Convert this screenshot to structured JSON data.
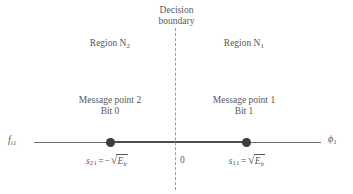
{
  "figure": {
    "type": "signal-space-constellation",
    "background_color": "#ffffff",
    "text_color": "#58585a",
    "line_color": "#4d4d4f",
    "dashed_color": "#9c9c9e",
    "point_color": "#3c3c3e"
  },
  "boundary_caption": {
    "line1": "Decision",
    "line2": "boundary"
  },
  "regions": {
    "left": {
      "prefix": "Region N",
      "subscript": "2"
    },
    "right": {
      "prefix": "Region N",
      "subscript": "1"
    }
  },
  "messages": {
    "left": {
      "line1": "Message point 2",
      "line2": "Bit 0"
    },
    "right": {
      "line1": "Message point 1",
      "line2": "Bit 1"
    }
  },
  "axis": {
    "left_label": {
      "symbol": "f",
      "subscript": "i1"
    },
    "right_label": {
      "symbol": "ϕ",
      "subscript": "1"
    },
    "origin_label": "0"
  },
  "values": {
    "left": {
      "symbol": "s",
      "subscript": "21",
      "equals": "=",
      "sign": "−",
      "radical": "√",
      "radicand": "E",
      "radicand_subscript": "b"
    },
    "right": {
      "symbol": "s",
      "subscript": "11",
      "equals": "=",
      "sign": "",
      "radical": "√",
      "radicand": "E",
      "radicand_subscript": "b"
    }
  },
  "chart_data": {
    "type": "scatter",
    "title": "Decision boundary",
    "xlabel": "ϕ1",
    "ylabel": "",
    "xlim": [
      -1.55,
      1.45
    ],
    "ylim": [
      0,
      0
    ],
    "grid": false,
    "legend": "none",
    "annotations": [
      "Decision boundary",
      "Region N2",
      "Region N1",
      "Message point 2 / Bit 0",
      "Message point 1 / Bit 1",
      "s21 = -sqrt(Eb)",
      "s11 = +sqrt(Eb)",
      "0",
      "fi1"
    ],
    "points": [
      {
        "label": "s21",
        "x": -1,
        "y": 0,
        "bit": "0",
        "region": "N2",
        "value": "-sqrt(Eb)"
      },
      {
        "label": "s11",
        "x": 1,
        "y": 0,
        "bit": "1",
        "region": "N1",
        "value": "+sqrt(Eb)"
      }
    ],
    "decision_boundary_x": 0
  }
}
